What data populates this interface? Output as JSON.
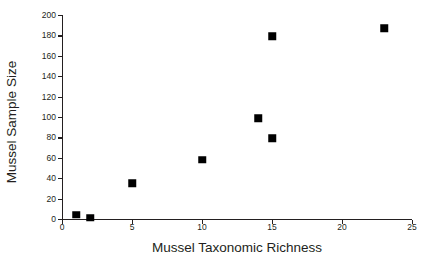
{
  "chart_data": {
    "type": "scatter",
    "title": "",
    "xlabel": "Mussel Taxonomic Richness",
    "ylabel": "Mussel Sample Size",
    "xlim": [
      0,
      25
    ],
    "ylim": [
      0,
      200
    ],
    "xticks": [
      0,
      5,
      10,
      15,
      20,
      25
    ],
    "yticks": [
      0,
      20,
      40,
      60,
      80,
      100,
      120,
      140,
      160,
      180,
      200
    ],
    "xtick_labels": [
      "0",
      "5",
      "10",
      "15",
      "20",
      "25"
    ],
    "ytick_labels": [
      "0",
      "20",
      "40",
      "60",
      "80",
      "100",
      "120",
      "140",
      "160",
      "180",
      "200"
    ],
    "grid": false,
    "legend": null,
    "marker": "square",
    "marker_color": "#000000",
    "series": [
      {
        "name": "Mussel samples",
        "points": [
          {
            "x": 1,
            "y": 4
          },
          {
            "x": 2,
            "y": 1
          },
          {
            "x": 5,
            "y": 35
          },
          {
            "x": 10,
            "y": 58
          },
          {
            "x": 14,
            "y": 99
          },
          {
            "x": 15,
            "y": 79
          },
          {
            "x": 15,
            "y": 179
          },
          {
            "x": 23,
            "y": 187
          }
        ]
      }
    ]
  },
  "style": {
    "axis_color": "#231f20",
    "background": "#ffffff",
    "point_color": "#000000"
  }
}
